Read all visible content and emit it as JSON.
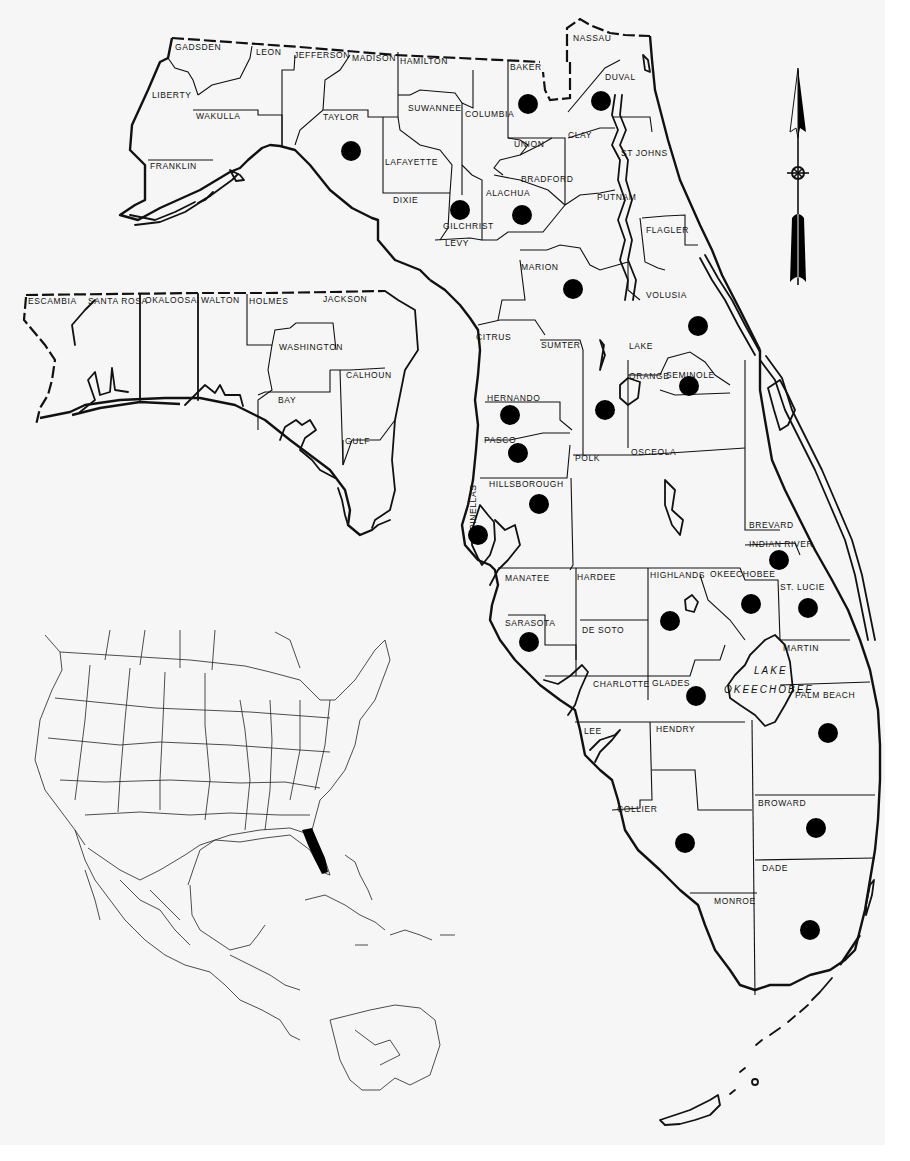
{
  "map": {
    "subject": "Florida county distribution map",
    "dot_color": "#000000",
    "outline_color": "#111111",
    "background": "#f6f6f6",
    "counties_north": [
      {
        "name": "GADSDEN",
        "x": 175,
        "y": 50
      },
      {
        "name": "LEON",
        "x": 256,
        "y": 55
      },
      {
        "name": "JEFFERSON",
        "x": 294,
        "y": 58
      },
      {
        "name": "MADISON",
        "x": 352,
        "y": 61
      },
      {
        "name": "HAMILTON",
        "x": 400,
        "y": 64
      },
      {
        "name": "LIBERTY",
        "x": 152,
        "y": 98
      },
      {
        "name": "WAKULLA",
        "x": 196,
        "y": 119
      },
      {
        "name": "TAYLOR",
        "x": 323,
        "y": 120
      },
      {
        "name": "SUWANNEE",
        "x": 408,
        "y": 111
      },
      {
        "name": "LAFAYETTE",
        "x": 385,
        "y": 165
      },
      {
        "name": "FRANKLIN",
        "x": 150,
        "y": 169
      },
      {
        "name": "DIXIE",
        "x": 393,
        "y": 203
      },
      {
        "name": "GILCHRIST",
        "x": 443,
        "y": 229
      },
      {
        "name": "LEVY",
        "x": 445,
        "y": 246
      },
      {
        "name": "NASSAU",
        "x": 573,
        "y": 41
      },
      {
        "name": "BAKER",
        "x": 510,
        "y": 70
      },
      {
        "name": "DUVAL",
        "x": 605,
        "y": 80
      },
      {
        "name": "COLUMBIA",
        "x": 465,
        "y": 117
      },
      {
        "name": "CLAY",
        "x": 568,
        "y": 138
      },
      {
        "name": "UNION",
        "x": 514,
        "y": 147
      },
      {
        "name": "ST JOHNS",
        "x": 621,
        "y": 156
      },
      {
        "name": "BRADFORD",
        "x": 521,
        "y": 182
      },
      {
        "name": "ALACHUA",
        "x": 486,
        "y": 196
      },
      {
        "name": "PUTNAM",
        "x": 597,
        "y": 200
      },
      {
        "name": "FLAGLER",
        "x": 646,
        "y": 233
      },
      {
        "name": "MARION",
        "x": 521,
        "y": 270
      }
    ],
    "counties_panhandle": [
      {
        "name": "ESCAMBIA",
        "x": 28,
        "y": 304
      },
      {
        "name": "SANTA ROSA",
        "x": 88,
        "y": 304
      },
      {
        "name": "OKALOOSA",
        "x": 145,
        "y": 303
      },
      {
        "name": "WALTON",
        "x": 201,
        "y": 303
      },
      {
        "name": "HOLMES",
        "x": 249,
        "y": 304
      },
      {
        "name": "JACKSON",
        "x": 323,
        "y": 302
      },
      {
        "name": "WASHINGTON",
        "x": 279,
        "y": 350
      },
      {
        "name": "CALHOUN",
        "x": 346,
        "y": 378
      },
      {
        "name": "BAY",
        "x": 278,
        "y": 403
      },
      {
        "name": "GULF",
        "x": 345,
        "y": 444
      }
    ],
    "counties_central_south": [
      {
        "name": "VOLUSIA",
        "x": 646,
        "y": 298
      },
      {
        "name": "CITRUS",
        "x": 476,
        "y": 340
      },
      {
        "name": "SUMTER",
        "x": 541,
        "y": 348
      },
      {
        "name": "LAKE",
        "x": 629,
        "y": 349
      },
      {
        "name": "ORANGE",
        "x": 629,
        "y": 379
      },
      {
        "name": "SEMINOLE",
        "x": 666,
        "y": 378
      },
      {
        "name": "HERNANDO",
        "x": 487,
        "y": 401
      },
      {
        "name": "PASCO",
        "x": 484,
        "y": 443
      },
      {
        "name": "POLK",
        "x": 575,
        "y": 461
      },
      {
        "name": "OSCEOLA",
        "x": 631,
        "y": 455
      },
      {
        "name": "HILLSBOROUGH",
        "x": 489,
        "y": 487
      },
      {
        "name": "PINELLAS",
        "x": 476,
        "y": 530
      },
      {
        "name": "BREVARD",
        "x": 749,
        "y": 528
      },
      {
        "name": "INDIAN RIVER",
        "x": 749,
        "y": 547
      },
      {
        "name": "MANATEE",
        "x": 505,
        "y": 581
      },
      {
        "name": "HARDEE",
        "x": 577,
        "y": 580
      },
      {
        "name": "HIGHLANDS",
        "x": 650,
        "y": 578
      },
      {
        "name": "OKEECHOBEE",
        "x": 710,
        "y": 577
      },
      {
        "name": "ST. LUCIE",
        "x": 780,
        "y": 590
      },
      {
        "name": "SARASOTA",
        "x": 505,
        "y": 626
      },
      {
        "name": "DE SOTO",
        "x": 582,
        "y": 633
      },
      {
        "name": "MARTIN",
        "x": 783,
        "y": 651
      },
      {
        "name": "CHARLOTTE",
        "x": 593,
        "y": 687
      },
      {
        "name": "GLADES",
        "x": 652,
        "y": 686
      },
      {
        "name": "PALM BEACH",
        "x": 795,
        "y": 698
      },
      {
        "name": "LEE",
        "x": 584,
        "y": 734
      },
      {
        "name": "HENDRY",
        "x": 656,
        "y": 732
      },
      {
        "name": "BROWARD",
        "x": 758,
        "y": 806
      },
      {
        "name": "COLLIER",
        "x": 617,
        "y": 812
      },
      {
        "name": "DADE",
        "x": 762,
        "y": 871
      },
      {
        "name": "MONROE",
        "x": 714,
        "y": 904
      }
    ],
    "lake_label": {
      "line1": "LAKE",
      "line2": "OKEECHOBEE",
      "x": 770,
      "y": 675
    },
    "dots": [
      {
        "county": "TAYLOR",
        "x": 351,
        "y": 151
      },
      {
        "county": "BAKER",
        "x": 528,
        "y": 104
      },
      {
        "county": "DUVAL",
        "x": 601,
        "y": 101
      },
      {
        "county": "GILCHRIST",
        "x": 460,
        "y": 210
      },
      {
        "county": "ALACHUA",
        "x": 522,
        "y": 215
      },
      {
        "county": "MARION",
        "x": 573,
        "y": 289
      },
      {
        "county": "VOLUSIA",
        "x": 698,
        "y": 326
      },
      {
        "county": "SEMINOLE",
        "x": 689,
        "y": 386
      },
      {
        "county": "LAKE",
        "x": 605,
        "y": 410
      },
      {
        "county": "HERNANDO",
        "x": 510,
        "y": 415
      },
      {
        "county": "PASCO",
        "x": 518,
        "y": 453
      },
      {
        "county": "HILLSBOROUGH",
        "x": 539,
        "y": 504
      },
      {
        "county": "PINELLAS",
        "x": 478,
        "y": 535
      },
      {
        "county": "INDIAN RIVER",
        "x": 779,
        "y": 560
      },
      {
        "county": "OKEECHOBEE",
        "x": 751,
        "y": 604
      },
      {
        "county": "ST. LUCIE",
        "x": 808,
        "y": 608
      },
      {
        "county": "HIGHLANDS",
        "x": 670,
        "y": 621
      },
      {
        "county": "SARASOTA",
        "x": 529,
        "y": 642
      },
      {
        "county": "GLADES",
        "x": 696,
        "y": 696
      },
      {
        "county": "PALM BEACH",
        "x": 828,
        "y": 733
      },
      {
        "county": "BROWARD",
        "x": 816,
        "y": 828
      },
      {
        "county": "COLLIER",
        "x": 685,
        "y": 843
      },
      {
        "county": "DADE",
        "x": 810,
        "y": 930
      }
    ],
    "north_arrow": {
      "x": 797,
      "y": 70,
      "symbol": "north-arrow-with-x-circle"
    },
    "locator_inset": {
      "region": "North America, Central America & Caribbean",
      "highlight": "Florida",
      "highlight_color": "#000000"
    }
  }
}
